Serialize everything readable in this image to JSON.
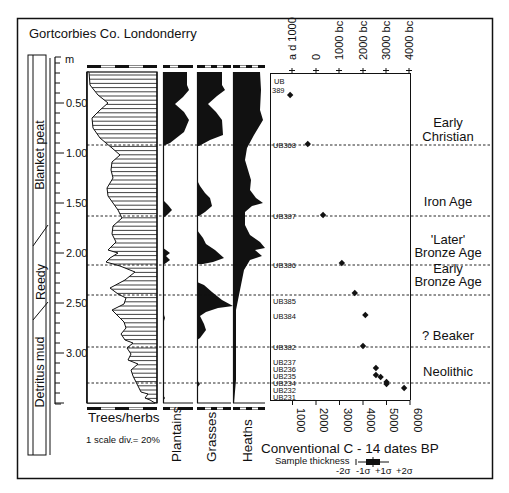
{
  "title": "Gortcorbies Co. Londonderry",
  "depth_axis": {
    "unit": "m",
    "ticks": [
      "0.50",
      "1.00",
      "1.50",
      "2.00",
      "2.50",
      "3.00"
    ]
  },
  "stratigraphy": {
    "units": [
      "Blanket peat",
      "Reedy",
      "Detritus mud"
    ]
  },
  "pollen_columns": [
    {
      "name": "Trees/herbs",
      "note": "1 scale div.= 20%"
    },
    {
      "name": "Plantains"
    },
    {
      "name": "Grasses"
    },
    {
      "name": "Heaths"
    }
  ],
  "scale_note": "1 scale div.= 20%",
  "date_axis": {
    "top_ticks": [
      "a d 1000",
      "0",
      "1000 bc",
      "2000 bc",
      "3000 bc",
      "4000 bc"
    ],
    "bottom_ticks": [
      "1000",
      "2000",
      "3000",
      "4000",
      "5000",
      "6000"
    ],
    "title": "Conventional C - 14 dates BP",
    "sample_thickness_label": "Sample thickness",
    "sigma_labels": [
      "-2σ",
      "-1σ",
      "+1σ",
      "+2σ"
    ]
  },
  "periods": [
    "Early Christian",
    "Iron Age",
    "'Later' Bronze Age",
    "Early Bronze Age",
    "? Beaker",
    "Neolithic"
  ],
  "chart_data": {
    "type": "scatter",
    "title": "Gortcorbies Co. Londonderry",
    "xlabel": "Conventional C - 14 dates BP",
    "ylabel": "Depth (m)",
    "xlim": [
      0,
      6000
    ],
    "ylim": [
      3.5,
      0.1
    ],
    "x_ticks_bottom": [
      1000,
      2000,
      3000,
      4000,
      5000,
      6000
    ],
    "x_ticks_top": [
      "a d 1000",
      "0",
      "1000 bc",
      "2000 bc",
      "3000 bc",
      "4000 bc"
    ],
    "y_ticks": [
      0.5,
      1.0,
      1.5,
      2.0,
      2.5,
      3.0
    ],
    "series": [
      {
        "name": "Radiocarbon dates",
        "points": [
          {
            "label": "UB 389",
            "depth": 0.42,
            "bp": 900
          },
          {
            "label": "UB368",
            "depth": 0.91,
            "bp": 1650
          },
          {
            "label": "UB387",
            "depth": 1.62,
            "bp": 2300
          },
          {
            "label": "UB386",
            "depth": 2.1,
            "bp": 3100
          },
          {
            "label": "UB385",
            "depth": 2.4,
            "bp": 3650
          },
          {
            "label": "UB384",
            "depth": 2.62,
            "bp": 4100
          },
          {
            "label": "UB382",
            "depth": 2.93,
            "bp": 4000
          },
          {
            "label": "UB237",
            "depth": 3.15,
            "bp": 4550
          },
          {
            "label": "UB236",
            "depth": 3.22,
            "bp": 4550
          },
          {
            "label": "UB235",
            "depth": 3.24,
            "bp": 4750
          },
          {
            "label": "UB234",
            "depth": 3.29,
            "bp": 5000
          },
          {
            "label": "UB232",
            "depth": 3.31,
            "bp": 5000
          },
          {
            "label": "UB231",
            "depth": 3.35,
            "bp": 5750
          }
        ]
      }
    ],
    "zone_boundaries_depth": [
      0.92,
      1.63,
      2.12,
      2.42,
      2.94,
      3.3
    ],
    "periods": [
      {
        "name": "Early Christian",
        "from_depth": 0.1,
        "to_depth": 0.92
      },
      {
        "name": "Iron Age",
        "from_depth": 0.92,
        "to_depth": 1.63
      },
      {
        "name": "'Later' Bronze Age",
        "from_depth": 1.63,
        "to_depth": 2.12
      },
      {
        "name": "Early Bronze Age",
        "from_depth": 2.12,
        "to_depth": 2.42
      },
      {
        "name": "? Beaker",
        "from_depth": 2.42,
        "to_depth": 2.94
      },
      {
        "name": "Neolithic",
        "from_depth": 2.94,
        "to_depth": 3.3
      }
    ],
    "pollen_curves": [
      "Trees/herbs",
      "Plantains",
      "Grasses",
      "Heaths"
    ],
    "grid": false
  }
}
